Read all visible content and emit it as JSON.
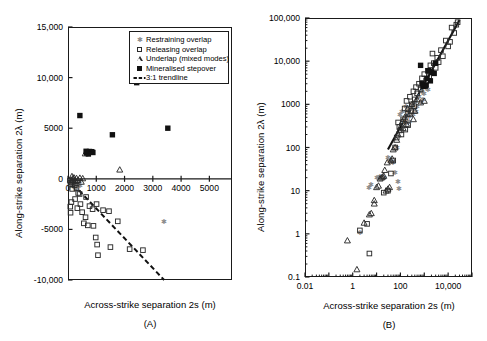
{
  "figure": {
    "panels": [
      {
        "tag": "(A)",
        "xlabel": "Across-strike separation 2s (m)",
        "ylabel": "Along-strike separation 2λ (m)",
        "legend": [
          {
            "symbol": "gray-star",
            "label": "Restraining overlap"
          },
          {
            "symbol": "open-square",
            "label": "Releasing overlap"
          },
          {
            "symbol": "open-triangle",
            "label": "Underlap (mixed modes)"
          },
          {
            "symbol": "filled-square",
            "label": "Mineralised stepover"
          },
          {
            "symbol": "dashed-line",
            "label": "3:1 trendline"
          }
        ]
      },
      {
        "tag": "(B)",
        "xlabel": "Across-strike separation 2s (m)",
        "ylabel": "Along-strike separation 2λ (m)"
      }
    ]
  },
  "chart_data": [
    {
      "type": "scatter",
      "title": "",
      "panel": "A",
      "xlabel": "Across-strike separation 2s (m)",
      "ylabel": "Along-strike separation 2λ (m)",
      "xscale": "linear",
      "yscale": "linear",
      "xlim": [
        0,
        5800
      ],
      "ylim": [
        -10000,
        15000
      ],
      "xticks": [
        0,
        1000,
        2000,
        3000,
        4000,
        5000
      ],
      "xticklabels": [
        "0",
        "1000",
        "2000",
        "3000",
        "4000",
        "5000"
      ],
      "yticks": [
        -10000,
        -5000,
        0,
        5000,
        10000,
        15000
      ],
      "yticklabels": [
        "-10,000",
        "-5000",
        "0",
        "5000",
        "10,000",
        "15,000"
      ],
      "grid": false,
      "legend_position": "upper-right",
      "trendline": {
        "label": "3:1 trendline",
        "style": "dashed",
        "slope": -3,
        "intercept": 0,
        "x_from": 0,
        "x_to": 3400,
        "y_from": 0,
        "y_to": -10000
      },
      "series": [
        {
          "name": "Restraining overlap",
          "marker": "gray-star",
          "color": "#8c8c8c",
          "points": [
            [
              60,
              -120
            ],
            [
              110,
              -260
            ],
            [
              150,
              -60
            ],
            [
              190,
              -330
            ],
            [
              230,
              -180
            ],
            [
              280,
              -420
            ],
            [
              320,
              -140
            ],
            [
              360,
              -520
            ],
            [
              400,
              -250
            ],
            [
              440,
              -640
            ],
            [
              120,
              -700
            ],
            [
              260,
              -880
            ],
            [
              300,
              -1040
            ],
            [
              170,
              -460
            ],
            [
              210,
              -760
            ],
            [
              3380,
              -4200
            ]
          ]
        },
        {
          "name": "Releasing overlap",
          "marker": "open-square",
          "color": "#2b2b2b",
          "points": [
            [
              70,
              -180
            ],
            [
              130,
              -380
            ],
            [
              90,
              -560
            ],
            [
              180,
              -300
            ],
            [
              240,
              -620
            ],
            [
              150,
              -1000
            ],
            [
              300,
              -900
            ],
            [
              360,
              -1400
            ],
            [
              120,
              -2300
            ],
            [
              80,
              -2750
            ],
            [
              90,
              -3350
            ],
            [
              330,
              -2900
            ],
            [
              440,
              -2500
            ],
            [
              500,
              -3300
            ],
            [
              560,
              -4400
            ],
            [
              620,
              -3800
            ],
            [
              700,
              -4600
            ],
            [
              760,
              -2700
            ],
            [
              870,
              -3000
            ],
            [
              900,
              -4650
            ],
            [
              980,
              -5800
            ],
            [
              1030,
              -6500
            ],
            [
              1060,
              -7550
            ],
            [
              1240,
              -3100
            ],
            [
              1450,
              -3200
            ],
            [
              1500,
              -6750
            ],
            [
              1760,
              -4200
            ],
            [
              2180,
              -6950
            ],
            [
              2650,
              -7050
            ],
            [
              1010,
              -2500
            ],
            [
              640,
              -1800
            ],
            [
              410,
              -1500
            ],
            [
              250,
              -2000
            ],
            [
              160,
              -150
            ]
          ]
        },
        {
          "name": "Underlap (mixed modes)",
          "marker": "open-triangle",
          "color": "#2b2b2b",
          "points": [
            [
              140,
              250
            ],
            [
              210,
              120
            ],
            [
              300,
              60
            ],
            [
              420,
              90
            ],
            [
              520,
              40
            ],
            [
              610,
              2500
            ],
            [
              1830,
              900
            ],
            [
              90,
              -90
            ],
            [
              260,
              -210
            ],
            [
              350,
              -140
            ],
            [
              470,
              -300
            ],
            [
              170,
              30
            ]
          ]
        },
        {
          "name": "Mineralised stepover",
          "marker": "filled-square",
          "color": "#111111",
          "points": [
            [
              420,
              6250
            ],
            [
              2430,
              9500
            ],
            [
              1570,
              4350
            ],
            [
              3530,
              5000
            ],
            [
              700,
              2650
            ],
            [
              760,
              2700
            ],
            [
              800,
              2620
            ],
            [
              840,
              2680
            ],
            [
              880,
              2600
            ],
            [
              660,
              2550
            ],
            [
              720,
              2450
            ],
            [
              640,
              2720
            ]
          ]
        }
      ]
    },
    {
      "type": "scatter",
      "panel": "B",
      "xlabel": "Across-strike separation 2s (m)",
      "ylabel": "Along-strike separation 2λ (m)",
      "xscale": "log",
      "yscale": "log",
      "xlim": [
        0.01,
        100000
      ],
      "ylim": [
        0.1,
        100000
      ],
      "xticks": [
        0.01,
        1,
        100,
        10000
      ],
      "xticklabels": [
        "0.01",
        "1",
        "100",
        "10,000"
      ],
      "yticks": [
        0.1,
        1,
        10,
        100,
        1000,
        10000,
        100000
      ],
      "yticklabels": [
        "0.1",
        "1",
        "10",
        "100",
        "1000",
        "10,000",
        "100,000"
      ],
      "grid": false,
      "trendline": {
        "label": "3:1 trendline",
        "style": "solid",
        "slope": 1,
        "x_from": 30,
        "x_to": 30000,
        "y_from": 90,
        "y_to": 90000
      },
      "series": [
        {
          "name": "Restraining overlap",
          "marker": "gray-star",
          "color": "#8c8c8c",
          "points": [
            [
              2,
              1.1
            ],
            [
              5,
              12
            ],
            [
              6,
              14
            ],
            [
              10,
              20
            ],
            [
              14,
              21
            ],
            [
              20,
              20
            ],
            [
              30,
              60
            ],
            [
              35,
              50
            ],
            [
              50,
              45
            ],
            [
              60,
              26
            ],
            [
              70,
              100
            ],
            [
              80,
              16
            ],
            [
              90,
              11
            ],
            [
              100,
              600
            ],
            [
              120,
              700
            ],
            [
              150,
              500
            ],
            [
              170,
              900
            ],
            [
              200,
              650
            ],
            [
              220,
              400
            ],
            [
              260,
              800
            ],
            [
              300,
              1000
            ],
            [
              350,
              600
            ],
            [
              400,
              1200
            ],
            [
              450,
              700
            ],
            [
              500,
              900
            ],
            [
              600,
              1500
            ],
            [
              700,
              1100
            ],
            [
              800,
              2000
            ],
            [
              900,
              1300
            ],
            [
              1000,
              1800
            ],
            [
              1200,
              2500
            ],
            [
              1500,
              2200
            ],
            [
              130,
              420
            ],
            [
              180,
              380
            ],
            [
              240,
              520
            ],
            [
              330,
              760
            ]
          ]
        },
        {
          "name": "Releasing overlap",
          "marker": "open-square",
          "color": "#2b2b2b",
          "points": [
            [
              2,
              1.2
            ],
            [
              4,
              1.7
            ],
            [
              5,
              0.35
            ],
            [
              20,
              9
            ],
            [
              30,
              10
            ],
            [
              40,
              25
            ],
            [
              50,
              50
            ],
            [
              60,
              100
            ],
            [
              70,
              170
            ],
            [
              90,
              300
            ],
            [
              110,
              200
            ],
            [
              130,
              450
            ],
            [
              150,
              800
            ],
            [
              180,
              1200
            ],
            [
              200,
              600
            ],
            [
              250,
              1500
            ],
            [
              300,
              1000
            ],
            [
              350,
              2000
            ],
            [
              400,
              1300
            ],
            [
              450,
              2500
            ],
            [
              500,
              1800
            ],
            [
              600,
              3000
            ],
            [
              700,
              2200
            ],
            [
              800,
              4000
            ],
            [
              900,
              2800
            ],
            [
              1000,
              5000
            ],
            [
              1200,
              3500
            ],
            [
              1400,
              6000
            ],
            [
              1600,
              4500
            ],
            [
              1800,
              8000
            ],
            [
              2000,
              5500
            ],
            [
              2500,
              9000
            ],
            [
              3000,
              7000
            ],
            [
              3500,
              12000
            ],
            [
              4000,
              9500
            ],
            [
              5000,
              18000
            ],
            [
              6000,
              13000
            ],
            [
              8000,
              30000
            ],
            [
              10000,
              22000
            ],
            [
              14000,
              60000
            ],
            [
              18000,
              45000
            ],
            [
              25000,
              80000
            ],
            [
              22000,
              70000
            ],
            [
              80,
              380
            ],
            [
              160,
              260
            ],
            [
              210,
              330
            ],
            [
              280,
              700
            ],
            [
              380,
              900
            ],
            [
              2200,
              15000
            ],
            [
              12000,
              28000
            ]
          ]
        },
        {
          "name": "Underlap (mixed modes)",
          "marker": "open-triangle",
          "color": "#2b2b2b",
          "points": [
            [
              0.6,
              0.7
            ],
            [
              1.5,
              0.15
            ],
            [
              3,
              1.8
            ],
            [
              5,
              2.8
            ],
            [
              6,
              3
            ],
            [
              8,
              6
            ],
            [
              10,
              12
            ],
            [
              12,
              13
            ],
            [
              14,
              19
            ],
            [
              16,
              20
            ],
            [
              18,
              21
            ],
            [
              20,
              22
            ],
            [
              25,
              10
            ],
            [
              30,
              11
            ],
            [
              35,
              12
            ],
            [
              40,
              50
            ],
            [
              45,
              55
            ],
            [
              50,
              90
            ],
            [
              60,
              100
            ],
            [
              70,
              150
            ],
            [
              80,
              200
            ],
            [
              90,
              250
            ],
            [
              100,
              300
            ],
            [
              120,
              400
            ],
            [
              150,
              500
            ],
            [
              180,
              350
            ],
            [
              200,
              800
            ],
            [
              250,
              600
            ],
            [
              300,
              1000
            ],
            [
              400,
              700
            ],
            [
              500,
              1300
            ],
            [
              700,
              1100
            ],
            [
              1000,
              1200
            ],
            [
              8,
              5
            ],
            [
              22,
              30
            ],
            [
              28,
              45
            ],
            [
              130,
              280
            ],
            [
              350,
              450
            ]
          ]
        },
        {
          "name": "Mineralised stepover",
          "marker": "filled-square",
          "color": "#111111",
          "points": [
            [
              900,
              2600
            ],
            [
              1000,
              2700
            ],
            [
              1100,
              2650
            ],
            [
              1200,
              2800
            ],
            [
              700,
              8000
            ],
            [
              1500,
              6000
            ],
            [
              2000,
              5500
            ],
            [
              2600,
              5200
            ],
            [
              3000,
              9000
            ],
            [
              800,
              3000
            ],
            [
              1300,
              4000
            ],
            [
              1800,
              3500
            ]
          ]
        }
      ]
    }
  ]
}
